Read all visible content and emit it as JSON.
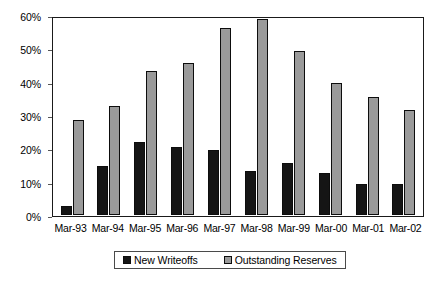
{
  "chart_data": {
    "type": "bar",
    "title": "",
    "subtitle": "",
    "xlabel": "",
    "ylabel": "",
    "ylim": [
      0,
      60
    ],
    "y_tick_labels": [
      "0%",
      "10%",
      "20%",
      "30%",
      "40%",
      "50%",
      "60%"
    ],
    "y_tick_values": [
      0,
      10,
      20,
      30,
      40,
      50,
      60
    ],
    "grid": false,
    "legend_position": "bottom",
    "categories": [
      "Mar-93",
      "Mar-94",
      "Mar-95",
      "Mar-96",
      "Mar-97",
      "Mar-98",
      "Mar-99",
      "Mar-00",
      "Mar-01",
      "Mar-02"
    ],
    "series": [
      {
        "name": "New Writeoffs",
        "color": "#151515",
        "values": [
          3,
          15,
          22.5,
          21,
          20,
          13.5,
          16,
          13,
          9.5,
          9.5
        ]
      },
      {
        "name": "Outstanding Reserves",
        "color": "#9a9a9a",
        "values": [
          29,
          33.5,
          44,
          46.5,
          57,
          60,
          50,
          40.5,
          36,
          32
        ]
      }
    ]
  },
  "legend": {
    "entries": [
      {
        "label": "New Writeoffs"
      },
      {
        "label": "Outstanding Reserves"
      }
    ]
  },
  "colors": {
    "writeoffs": "#151515",
    "reserves": "#9a9a9a",
    "frame": "#1a1a1a",
    "background": "#ffffff"
  }
}
